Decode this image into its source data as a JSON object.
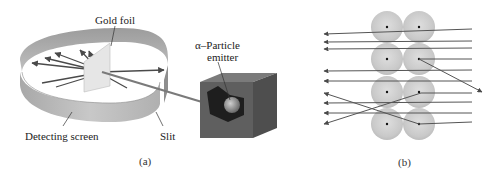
{
  "figure_a": {
    "caption": "(a)",
    "labels": {
      "gold_foil": "Gold foil",
      "emitter_line1": "α–Particle",
      "emitter_line2": "emitter",
      "detecting_screen": "Detecting screen",
      "slit": "Slit"
    }
  },
  "figure_b": {
    "caption": "(b)",
    "atoms": [
      {
        "cx": 387,
        "cy": 27
      },
      {
        "cx": 419,
        "cy": 27
      },
      {
        "cx": 387,
        "cy": 59
      },
      {
        "cx": 419,
        "cy": 59
      },
      {
        "cx": 387,
        "cy": 92
      },
      {
        "cx": 419,
        "cy": 92
      },
      {
        "cx": 387,
        "cy": 124
      },
      {
        "cx": 419,
        "cy": 124
      }
    ],
    "particle_paths": [
      {
        "type": "reflected-shallow",
        "start": [
          472,
          29
        ],
        "end": [
          324,
          34
        ]
      },
      {
        "type": "straight",
        "start": [
          472,
          41
        ],
        "end": [
          324,
          42
        ]
      },
      {
        "type": "straight",
        "start": [
          472,
          48
        ],
        "end": [
          324,
          49
        ]
      },
      {
        "type": "deflected",
        "start": [
          472,
          59
        ],
        "via": [
          419,
          59
        ],
        "end": [
          482,
          92
        ]
      },
      {
        "type": "straight",
        "start": [
          472,
          70
        ],
        "end": [
          324,
          71
        ]
      },
      {
        "type": "straight",
        "start": [
          472,
          81
        ],
        "end": [
          324,
          81
        ]
      },
      {
        "type": "backscatter",
        "start": [
          472,
          93
        ],
        "via": [
          419,
          93
        ],
        "end": [
          324,
          124
        ]
      },
      {
        "type": "straight",
        "start": [
          472,
          102
        ],
        "end": [
          324,
          103
        ]
      },
      {
        "type": "straight",
        "start": [
          472,
          113
        ],
        "end": [
          324,
          113
        ]
      },
      {
        "type": "backscatter",
        "start": [
          472,
          122
        ],
        "via": [
          419,
          124
        ],
        "end": [
          324,
          93
        ]
      }
    ]
  },
  "colors": {
    "screen": "#b9b9b9",
    "screen_dark": "#9a9a9a",
    "box": "#5e5e5e",
    "arrow": "#4a4a4a",
    "atom": "#cfcfcf"
  }
}
